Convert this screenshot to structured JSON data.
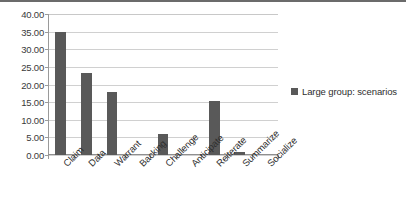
{
  "chart_data": {
    "type": "bar",
    "title": "",
    "subtitle": "",
    "xlabel": "",
    "ylabel": "",
    "categories": [
      "Claim",
      "Data",
      "Warrant",
      "Backing",
      "Challenge",
      "Anticipate",
      "Reiterate",
      "Summarize",
      "Socialize"
    ],
    "series": [
      {
        "name": "Large group: scenarios",
        "values": [
          35.0,
          23.2,
          18.0,
          0.0,
          6.0,
          0.0,
          15.3,
          0.8,
          0.0
        ],
        "color": "#595959"
      }
    ],
    "ylim": [
      0,
      40
    ],
    "ytick_step": 5,
    "ytick_labels": [
      "0.00",
      "5.00",
      "10.00",
      "15.00",
      "20.00",
      "25.00",
      "30.00",
      "35.00",
      "40.00"
    ],
    "ytick_values": [
      0,
      5,
      10,
      15,
      20,
      25,
      30,
      35,
      40
    ],
    "grid": true,
    "grid_axis": "y",
    "legend": {
      "position": "right",
      "entries": [
        {
          "label": "Large group: scenarios",
          "color": "#595959"
        }
      ]
    },
    "xtick_label_rotation": -45,
    "plot_background": "#ffffff",
    "gridline_color": "#d0d0d0",
    "axis_color": "#9a9a9a"
  }
}
